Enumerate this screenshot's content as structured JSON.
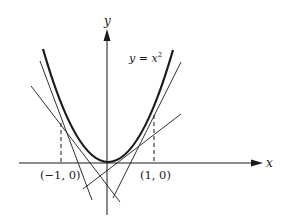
{
  "diagram": {
    "axes": {
      "x_label": "x",
      "y_label": "y"
    },
    "curve_label": {
      "lhs": "y",
      "eq": " = ",
      "base": "x",
      "exp": "2"
    },
    "points": [
      {
        "label": "(−1, 0)",
        "x": -1,
        "y": 0
      },
      {
        "label": "(1, 0)",
        "x": 1,
        "y": 0
      }
    ],
    "colors": {
      "stroke": "#1a1a1a",
      "background": "#ffffff"
    }
  }
}
